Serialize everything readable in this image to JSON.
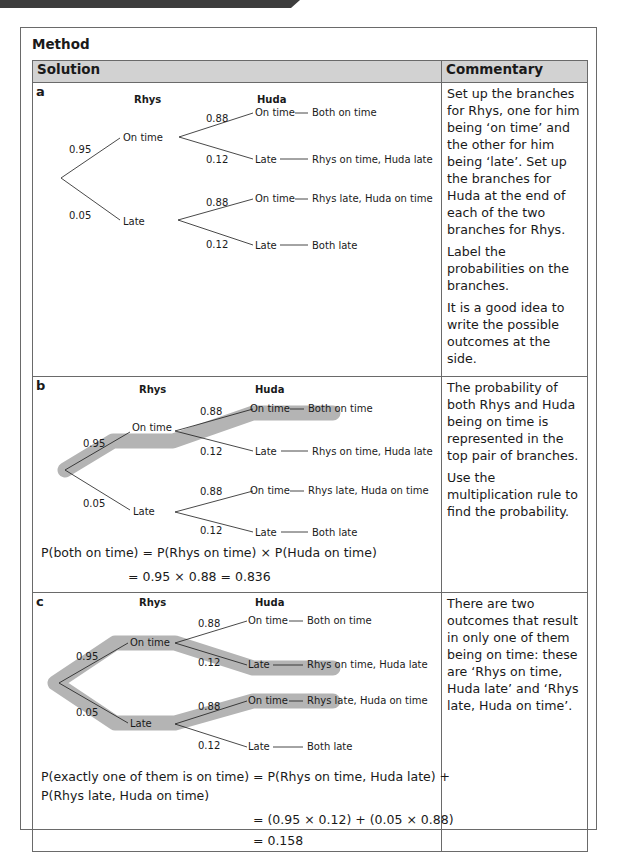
{
  "header": {
    "title": "Method",
    "col_solution": "Solution",
    "col_commentary": "Commentary"
  },
  "colors": {
    "header_bg": "#d2d2d2",
    "highlight": "#b4b4b4",
    "border": "#6a6a6a",
    "topbar": "#3d3d3d"
  },
  "tree_labels": {
    "rhys": "Rhys",
    "huda": "Huda",
    "on_time": "On time",
    "late": "Late",
    "p_rhys_on_time": "0.95",
    "p_rhys_late": "0.05",
    "p_huda_on_time": "0.88",
    "p_huda_late": "0.12",
    "outcome_both_on_time": "Both on time",
    "outcome_rhys_on_huda_late": "Rhys on time, Huda late",
    "outcome_rhys_late_huda_on": "Rhys late, Huda on time",
    "outcome_both_late": "Both late"
  },
  "parts": [
    {
      "letter": "a",
      "commentary": [
        "Set up the branches for Rhys, one for him being ‘on time’ and the other for him being ‘late’. Set up the branches for Huda at the end of each of the two branches for Rhys.",
        "Label the probabilities on the branches.",
        "It is a good idea to write the possible outcomes at the side."
      ]
    },
    {
      "letter": "b",
      "equation_line1": "P(both on time) = P(Rhys on time) × P(Huda on time)",
      "equation_line2": "= 0.95 × 0.88 = 0.836",
      "commentary": [
        "The probability of both Rhys and Huda being on time is represented in the top pair of branches.",
        "Use the multiplication rule to find the probability."
      ]
    },
    {
      "letter": "c",
      "equation_line1": "P(exactly one of them is on time) = P(Rhys on time, Huda late) +",
      "equation_line2": "P(Rhys late, Huda on time)",
      "equation_line3": "= (0.95 × 0.12) + (0.05 × 0.88)",
      "equation_line4": "= 0.158",
      "commentary": [
        "There are two outcomes that result in only one of them being on time: these are ‘Rhys on time, Huda late’ and ‘Rhys late, Huda on time’."
      ]
    }
  ]
}
